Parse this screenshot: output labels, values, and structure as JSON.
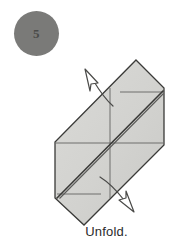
{
  "step": {
    "number": "5",
    "badge_color": "#7a7a78",
    "number_color": "#4a4a48"
  },
  "caption": {
    "text": "Unfold."
  },
  "figure": {
    "paper_fill": "#d2d2cf",
    "paper_fill_light": "#dcdcd9",
    "edge_color": "#3a3a38",
    "crease_color": "#6f6f6d",
    "arrow_outline_color": "#4a4a48",
    "arrow_fill": "#ffffff",
    "outline": [
      [
        136,
        60
      ],
      [
        164,
        88
      ],
      [
        164,
        145
      ],
      [
        84,
        225
      ],
      [
        55,
        198
      ],
      [
        55,
        142
      ]
    ],
    "main_crease": {
      "from": [
        57,
        197
      ],
      "to": [
        163,
        89
      ]
    },
    "creases": [
      {
        "name": "horizontal-mid",
        "from": [
          55,
          143
        ],
        "to": [
          164,
          143
        ]
      },
      {
        "name": "vertical-mid",
        "from": [
          110,
          88
        ],
        "to": [
          110,
          198
        ]
      },
      {
        "name": "top-right-edge-fold",
        "from": [
          120,
          92
        ],
        "to": [
          163,
          92
        ]
      },
      {
        "name": "bottom-left-edge-fold",
        "from": [
          57,
          194
        ],
        "to": [
          100,
          194
        ]
      }
    ],
    "arrows": [
      {
        "name": "unfold-arrow-upper-left",
        "direction": "up-left",
        "tip": [
          85,
          70
        ],
        "tail": [
          113,
          106
        ]
      },
      {
        "name": "unfold-arrow-lower-right",
        "direction": "down-right",
        "tip": [
          133,
          212
        ],
        "tail": [
          100,
          177
        ]
      }
    ]
  }
}
